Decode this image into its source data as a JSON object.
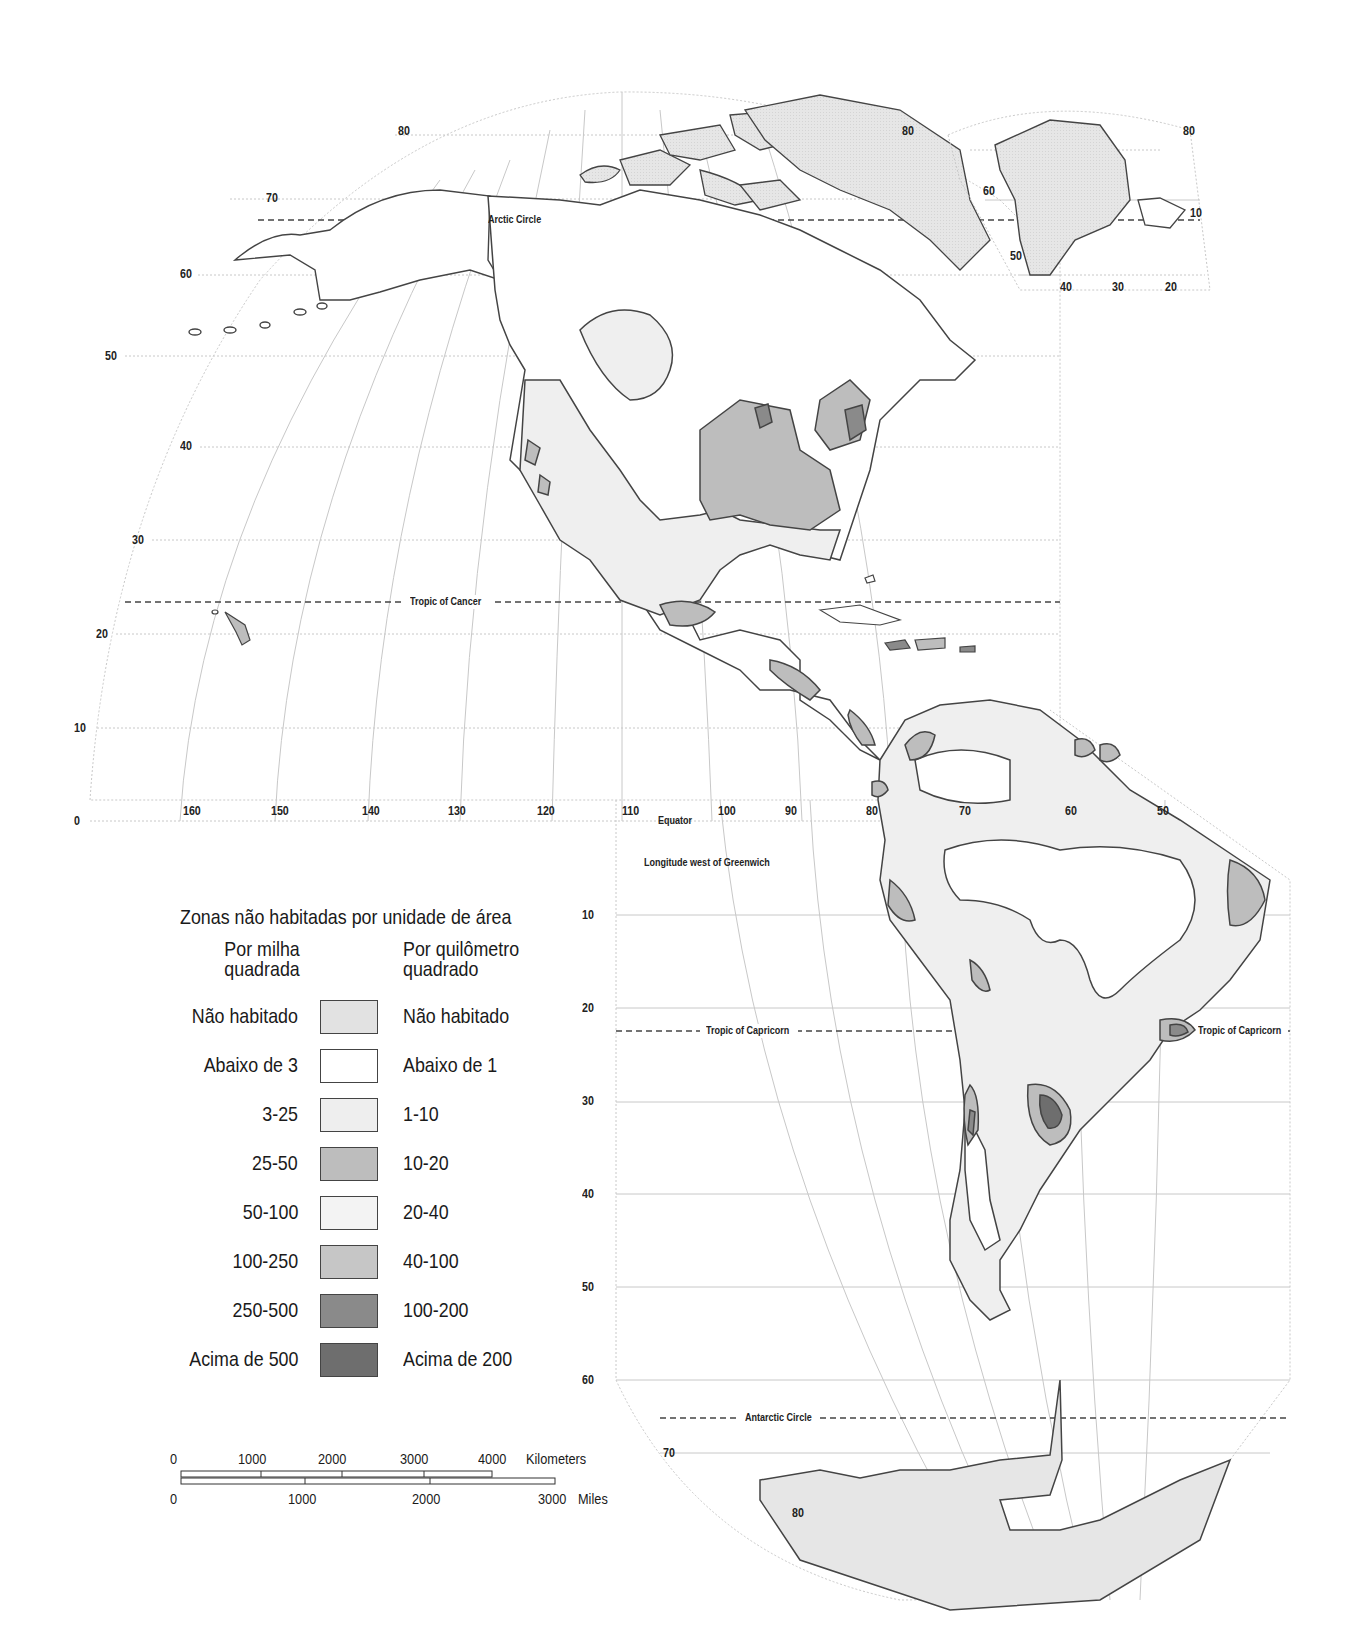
{
  "map": {
    "title": "Zonas não habitadas por unidade de área",
    "projection_note": "Longitude west of Greenwich",
    "reference_lines": {
      "arctic_circle": "Arctic Circle",
      "tropic_of_cancer": "Tropic of Cancer",
      "equator": "Equator",
      "tropic_of_capricorn_left": "Tropic of Capricorn",
      "tropic_of_capricorn_right": "Tropic of Capricorn",
      "antarctic_circle": "Antarctic Circle"
    },
    "latitude_labels_north": [
      "80",
      "70",
      "60",
      "50",
      "40",
      "30",
      "20",
      "10",
      "0"
    ],
    "latitude_label_north_right": "80",
    "longitude_labels": [
      "160",
      "150",
      "140",
      "130",
      "120",
      "110",
      "100",
      "90",
      "80",
      "70",
      "60",
      "50"
    ],
    "latitude_labels_south": [
      "10",
      "20",
      "30",
      "40",
      "50",
      "60",
      "70",
      "80"
    ],
    "greenland_inset": {
      "lat_labels": [
        "80",
        "60",
        "50"
      ],
      "lon_labels": [
        "40",
        "30",
        "20",
        "10"
      ]
    }
  },
  "legend": {
    "header_left": "Por milha\nquadrada",
    "header_left_1": "Por milha",
    "header_left_2": "quadrada",
    "header_right_1": "Por quilômetro",
    "header_right_2": "quadrado",
    "rows": [
      {
        "per_sq_mile": "Não habitado",
        "per_sq_km": "Não habitado",
        "color": "#e2e2e2"
      },
      {
        "per_sq_mile": "Abaixo de 3",
        "per_sq_km": "Abaixo de 1",
        "color": "#ffffff"
      },
      {
        "per_sq_mile": "3-25",
        "per_sq_km": "1-10",
        "color": "#eeeeee"
      },
      {
        "per_sq_mile": "25-50",
        "per_sq_km": "10-20",
        "color": "#bdbdbd"
      },
      {
        "per_sq_mile": "50-100",
        "per_sq_km": "20-40",
        "color": "#f3f3f3"
      },
      {
        "per_sq_mile": "100-250",
        "per_sq_km": "40-100",
        "color": "#c6c6c6"
      },
      {
        "per_sq_mile": "250-500",
        "per_sq_km": "100-200",
        "color": "#8a8a8a"
      },
      {
        "per_sq_mile": "Acima de 500",
        "per_sq_km": "Acima de 200",
        "color": "#6e6e6e"
      }
    ]
  },
  "scale_bar": {
    "km_ticks": [
      "0",
      "1000",
      "2000",
      "3000",
      "4000"
    ],
    "km_unit": "Kilometers",
    "mile_ticks": [
      "0",
      "1000",
      "2000",
      "3000"
    ],
    "mile_unit": "Miles"
  },
  "colors": {
    "coast": "#444444",
    "grid": "#bdbdbd",
    "uninhabited": "#e2e2e2",
    "sparse": "#efefef",
    "medium": "#bdbdbd",
    "dense": "#8a8a8a",
    "densest": "#6e6e6e"
  }
}
